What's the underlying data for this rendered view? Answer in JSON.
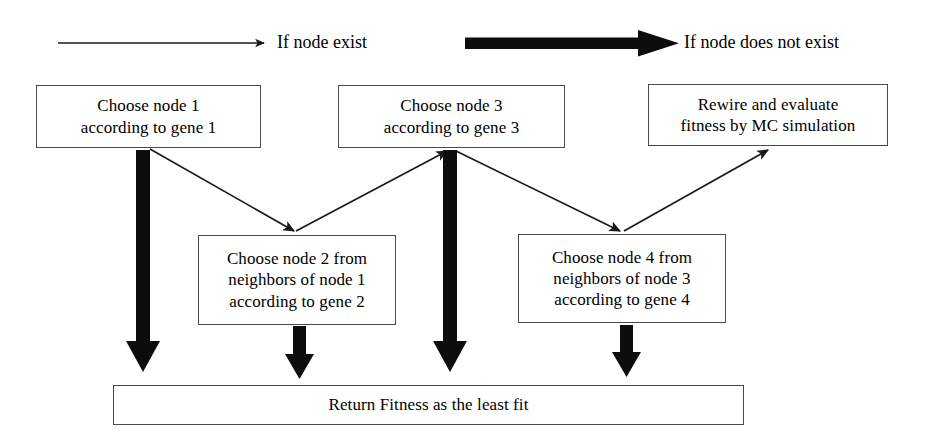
{
  "diagram": {
    "legend": [
      {
        "id": "thin",
        "label": "If node exist",
        "arrow_style": "thin-line",
        "color": "#1a1a1a"
      },
      {
        "id": "thick",
        "label": "If node does not exist",
        "arrow_style": "thick-block",
        "color": "#000000"
      }
    ],
    "boxes": [
      {
        "id": "node1",
        "text": "Choose node 1\naccording to gene 1",
        "x": 36,
        "y": 85,
        "w": 225,
        "h": 63
      },
      {
        "id": "node3",
        "text": "Choose node 3\naccording to gene 3",
        "x": 338,
        "y": 85,
        "w": 227,
        "h": 63
      },
      {
        "id": "rewire",
        "text": "Rewire and evaluate\nfitness by MC simulation",
        "x": 648,
        "y": 84,
        "w": 240,
        "h": 62
      },
      {
        "id": "node2",
        "text": "Choose node 2 from\nneighbors of node 1\naccording to gene 2",
        "x": 198,
        "y": 235,
        "w": 198,
        "h": 90
      },
      {
        "id": "node4",
        "text": "Choose node 4 from\nneighbors of node 3\naccording to gene 4",
        "x": 518,
        "y": 234,
        "w": 208,
        "h": 89
      },
      {
        "id": "return",
        "text": "Return Fitness as the least fit",
        "x": 113,
        "y": 385,
        "w": 631,
        "h": 40
      }
    ],
    "edges": [
      {
        "id": "e1",
        "from": "node1",
        "to": "node2",
        "style": "thin",
        "note": "arrow down-right into top of Choose node 2"
      },
      {
        "id": "e2",
        "from": "node2",
        "to": "node3",
        "style": "thin",
        "note": "arrow up-right into bottom of Choose node 3"
      },
      {
        "id": "e3",
        "from": "node3",
        "to": "node4",
        "style": "thin",
        "note": "arrow down-right into top of Choose node 4"
      },
      {
        "id": "e4",
        "from": "node4",
        "to": "rewire",
        "style": "thin",
        "note": "arrow up-right into bottom of Rewire box"
      },
      {
        "id": "e5",
        "from": "node1",
        "to": "return",
        "style": "thick",
        "note": "thick arrow straight down to Return Fitness"
      },
      {
        "id": "e6",
        "from": "node2",
        "to": "return",
        "style": "thick",
        "note": "thick arrow straight down to Return Fitness"
      },
      {
        "id": "e7",
        "from": "node3",
        "to": "return",
        "style": "thick",
        "note": "thick arrow straight down to Return Fitness"
      },
      {
        "id": "e8",
        "from": "node4",
        "to": "return",
        "style": "thick",
        "note": "thick arrow straight down to Return Fitness"
      }
    ]
  }
}
